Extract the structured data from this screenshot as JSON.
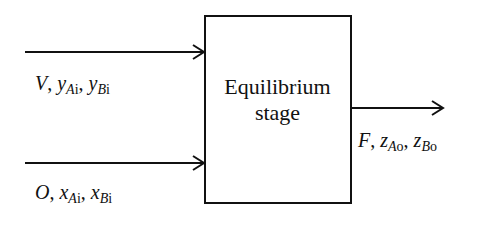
{
  "diagram": {
    "type": "process-flow",
    "stage": {
      "line1": "Equilibrium",
      "line2": "stage"
    },
    "inputs": [
      {
        "stream": "V",
        "vars": [
          {
            "sym": "y",
            "sub_a": "A",
            "sub_b": "i"
          },
          {
            "sym": "y",
            "sub_a": "B",
            "sub_b": "i"
          }
        ]
      },
      {
        "stream": "O",
        "vars": [
          {
            "sym": "x",
            "sub_a": "A",
            "sub_b": "i"
          },
          {
            "sym": "x",
            "sub_a": "B",
            "sub_b": "i"
          }
        ]
      }
    ],
    "output": {
      "stream": "F",
      "vars": [
        {
          "sym": "z",
          "sub_a": "A",
          "sub_b": "o"
        },
        {
          "sym": "z",
          "sub_a": "B",
          "sub_b": "o"
        }
      ]
    },
    "separator": ", ",
    "line_color": "#111111"
  }
}
